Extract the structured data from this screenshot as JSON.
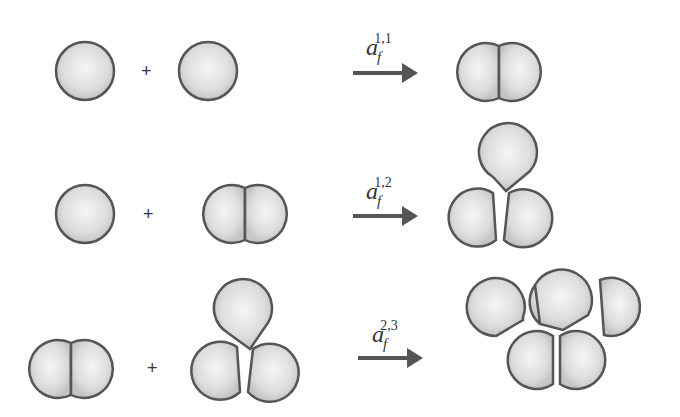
{
  "diagram": {
    "colors": {
      "fill_center": "#f4f4f4",
      "fill_edge": "#c9c9c9",
      "stroke": "#555555",
      "arrow": "#555555"
    },
    "plus_symbol": "+",
    "reactions": [
      {
        "reactant_a": "monomer (1 particle)",
        "reactant_b": "monomer (1 particle)",
        "rate_symbol": "a",
        "rate_subscript": "f",
        "rate_superscript": "1,1",
        "product": "dimer (2 particles)"
      },
      {
        "reactant_a": "monomer (1 particle)",
        "reactant_b": "dimer (2 particles)",
        "rate_symbol": "a",
        "rate_subscript": "f",
        "rate_superscript": "1,2",
        "product": "trimer (3 particles)"
      },
      {
        "reactant_a": "dimer (2 particles)",
        "reactant_b": "trimer (3 particles)",
        "rate_symbol": "a",
        "rate_subscript": "f",
        "rate_superscript": "2,3",
        "product": "pentamer (5 particles)"
      }
    ]
  }
}
